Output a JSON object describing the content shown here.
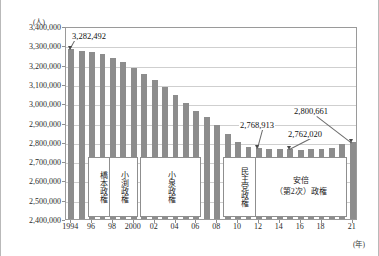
{
  "chart_data": {
    "type": "bar",
    "title": "",
    "xlabel": "(年)",
    "ylabel": "(人)",
    "ylim": [
      2400000,
      3400000
    ],
    "ytick_step": 100000,
    "grid": true,
    "legend": "none",
    "yticks": [
      "3,400,000",
      "3,300,000",
      "3,200,000",
      "3,100,000",
      "3,000,000",
      "2,900,000",
      "2,800,000",
      "2,700,000",
      "2,600,000",
      "2,500,000",
      "2,400,000"
    ],
    "x": [
      1994,
      1995,
      1996,
      1997,
      1998,
      1999,
      2000,
      2001,
      2002,
      2003,
      2004,
      2005,
      2006,
      2007,
      2008,
      2009,
      2010,
      2011,
      2012,
      2013,
      2014,
      2015,
      2016,
      2017,
      2018,
      2019,
      2020,
      2021
    ],
    "xtick_labels": [
      "1994",
      "96",
      "98",
      "2000",
      "02",
      "04",
      "06",
      "08",
      "10",
      "12",
      "14",
      "16",
      "18",
      "21"
    ],
    "xtick_values": [
      1994,
      1996,
      1998,
      2000,
      2002,
      2004,
      2006,
      2008,
      2010,
      2012,
      2014,
      2016,
      2018,
      2021
    ],
    "values": [
      3282492,
      3273000,
      3267000,
      3253000,
      3236000,
      3214000,
      3180000,
      3151000,
      3118000,
      3083000,
      3044000,
      3003000,
      2962000,
      2930000,
      2889000,
      2840000,
      2800000,
      2775000,
      2768913,
      2763000,
      2761000,
      2762020,
      2760000,
      2761000,
      2763000,
      2770000,
      2790000,
      2800661
    ],
    "series_name": "人数",
    "bar_color": "#8d8d8d",
    "annotations": [
      {
        "label": "3,282,492",
        "year": 1994,
        "value": 3282492
      },
      {
        "label": "2,768,913",
        "year": 2012,
        "value": 2768913
      },
      {
        "label": "2,762,020",
        "year": 2015,
        "value": 2762020
      },
      {
        "label": "2,800,661",
        "year": 2021,
        "value": 2800661
      }
    ],
    "era_boxes": [
      {
        "name": "hashimoto",
        "label": "橋本政権",
        "orientation": "vertical",
        "start_year": 1996,
        "end_year": 1998
      },
      {
        "name": "obuchi",
        "label": "小渕政権",
        "orientation": "vertical",
        "start_year": 1998,
        "end_year": 2000
      },
      {
        "name": "koizumi",
        "label": "小泉政権",
        "orientation": "vertical",
        "start_year": 2001,
        "end_year": 2006
      },
      {
        "name": "minshuto",
        "label": "民主党政権",
        "orientation": "vertical",
        "start_year": 2009,
        "end_year": 2012
      },
      {
        "name": "abe2",
        "label": "安倍\n（第2次）政権",
        "orientation": "horizontal",
        "start_year": 2012,
        "end_year": 2020
      }
    ]
  }
}
